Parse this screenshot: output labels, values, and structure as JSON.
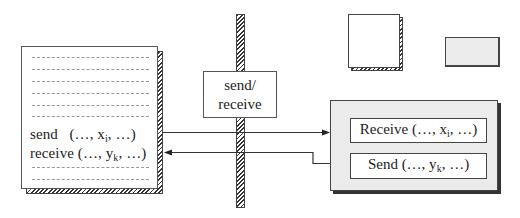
{
  "diagram": {
    "title": "",
    "left_document": {
      "dashed_lines_top": 6,
      "dashed_lines_bottom": 2,
      "lines": [
        {
          "keyword": "send",
          "args_prefix": "(…, x",
          "subscript": "i",
          "args_suffix": ", …)"
        },
        {
          "keyword": "receive",
          "args_prefix": "(…, y",
          "subscript": "k",
          "args_suffix": ", …)"
        }
      ]
    },
    "barrier": {
      "label_line1": "send/",
      "label_line2": "receive"
    },
    "right_panel": {
      "items": [
        {
          "keyword": "Receive",
          "args_prefix": "(…, x",
          "subscript": "i",
          "args_suffix": ", …)"
        },
        {
          "keyword": "Send",
          "args_prefix": "(…, y",
          "subscript": "k",
          "args_suffix": ", …)"
        }
      ]
    },
    "legend_shapes": [
      {
        "shape": "white-square-hatched-shadow"
      },
      {
        "shape": "gray-rectangle"
      }
    ],
    "arrows": [
      {
        "from": "left_document.send",
        "to": "right_panel.Receive",
        "direction": "right"
      },
      {
        "from": "right_panel.Send",
        "to": "left_document.receive",
        "direction": "left"
      }
    ],
    "colors": {
      "stroke": "#444444",
      "panel_fill": "#ebebeb",
      "dash": "#999999"
    }
  }
}
